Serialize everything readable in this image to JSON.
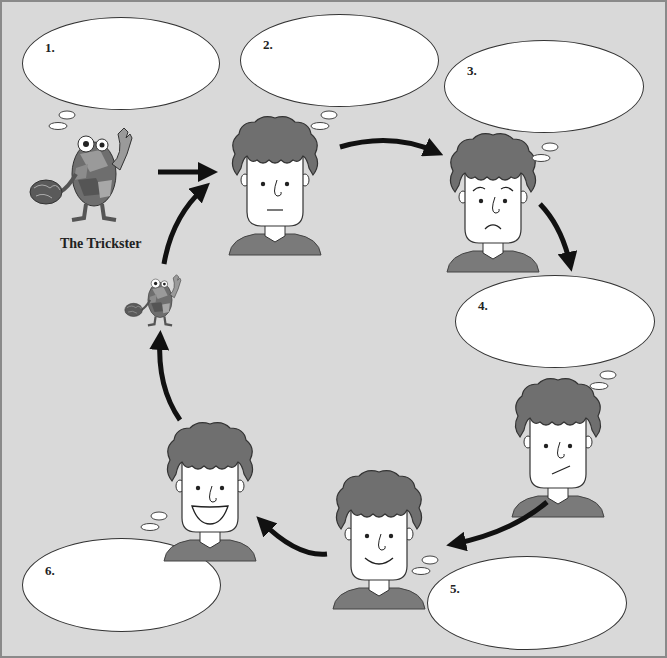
{
  "trickster": {
    "label": "The Trickster"
  },
  "bubbles": [
    {
      "num": "1.",
      "text": ""
    },
    {
      "num": "2.",
      "text": ""
    },
    {
      "num": "3.",
      "text": ""
    },
    {
      "num": "4.",
      "text": ""
    },
    {
      "num": "5.",
      "text": ""
    },
    {
      "num": "6.",
      "text": ""
    }
  ],
  "faces": [
    {
      "step": 2,
      "expression": "neutral"
    },
    {
      "step": 3,
      "expression": "sad"
    },
    {
      "step": 4,
      "expression": "doubtful"
    },
    {
      "step": 5,
      "expression": "smile"
    },
    {
      "step": 6,
      "expression": "big-smile"
    }
  ],
  "colors": {
    "background": "#d9d9d9",
    "hair": "#6f6f6f",
    "shirt": "#7a7a7a",
    "arrow": "#111111",
    "bubble": "#ffffff"
  }
}
